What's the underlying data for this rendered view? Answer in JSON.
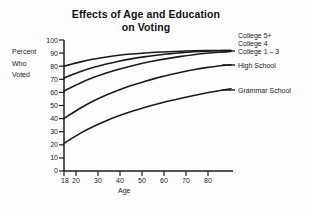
{
  "chart_data": {
    "type": "line",
    "title": "Effects of Age and Education on Voting",
    "title_line1": "Effects of Age and Education",
    "title_line2": "on Voting",
    "xlabel": "Age",
    "ylabel": "Percent Who Voted",
    "ylabel_line1": "Percent",
    "ylabel_line2": "Who",
    "ylabel_line3": "Voted",
    "xlim": [
      18,
      85
    ],
    "ylim": [
      0,
      100
    ],
    "grid": false,
    "legend_position": "right-inline",
    "xticks": [
      18,
      20,
      30,
      40,
      50,
      60,
      70,
      80
    ],
    "xtick_labels": [
      "18",
      "20",
      "30",
      "40",
      "50",
      "60",
      "70",
      "80"
    ],
    "yticks": [
      0,
      10,
      20,
      30,
      40,
      50,
      60,
      70,
      80,
      90,
      100
    ],
    "ytick_labels": [
      "0",
      "10",
      "20",
      "30",
      "40",
      "50",
      "60",
      "70",
      "80",
      "90",
      "100"
    ],
    "x": [
      18,
      20,
      25,
      30,
      35,
      40,
      45,
      50,
      55,
      60,
      65,
      70,
      75,
      80,
      85
    ],
    "series": [
      {
        "name": "College 5+",
        "label": "College 5+",
        "color": "#1b1b1b",
        "values": [
          80,
          81,
          83.5,
          85.5,
          87,
          88.3,
          89.3,
          90,
          90.6,
          91,
          91.4,
          91.7,
          91.9,
          92,
          92
        ]
      },
      {
        "name": "College 4",
        "label": "College 4",
        "color": "#1b1b1b",
        "values": [
          71,
          72.6,
          76.2,
          79.2,
          81.7,
          83.8,
          85.6,
          87.1,
          88.4,
          89.4,
          90.3,
          91,
          91.5,
          91.8,
          92
        ]
      },
      {
        "name": "College 1 – 3",
        "label": "College 1 – 3",
        "color": "#1b1b1b",
        "values": [
          61,
          63,
          67.6,
          71.5,
          74.8,
          77.7,
          80.2,
          82.4,
          84.3,
          86,
          87.5,
          88.8,
          89.9,
          90.7,
          91.2
        ]
      },
      {
        "name": "High School",
        "label": "High School",
        "color": "#1b1b1b",
        "values": [
          40,
          42.6,
          48.5,
          53.6,
          58,
          61.8,
          65.2,
          68.2,
          70.9,
          73.3,
          75.4,
          77.3,
          78.9,
          80.2,
          81
        ]
      },
      {
        "name": "Grammar School",
        "label": "Grammar School",
        "color": "#1b1b1b",
        "values": [
          21,
          23.6,
          29.3,
          34.2,
          38.4,
          42.1,
          45.4,
          48.3,
          51,
          53.4,
          55.6,
          57.6,
          59.5,
          61.2,
          62.8
        ]
      }
    ]
  },
  "legend": {
    "items": [
      {
        "label": "College 5+"
      },
      {
        "label": "College 4"
      },
      {
        "label": "College 1 – 3"
      },
      {
        "label": "High School"
      },
      {
        "label": "Grammar School"
      }
    ]
  },
  "colors": {
    "background": "#fdfdfd",
    "ink": "#1b1b1b"
  }
}
